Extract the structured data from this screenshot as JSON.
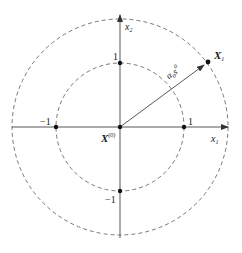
{
  "diagram": {
    "title": "",
    "origin_label": {
      "base": "X",
      "superscript": "(0)"
    },
    "axes": {
      "x": {
        "base": "x",
        "subscript": "1"
      },
      "y": {
        "base": "x",
        "subscript": "2"
      }
    },
    "tick_labels": {
      "x_pos": "1",
      "x_neg": "−1",
      "y_pos": "1",
      "y_neg": "−1"
    },
    "point_label": {
      "base": "X",
      "subscript": "1"
    },
    "vector_label": {
      "base": "α",
      "subscript": "0",
      "var": "s",
      "superscript": "0"
    },
    "circles": [
      {
        "name": "inner",
        "radius_units": 1,
        "style": "dashed"
      },
      {
        "name": "outer",
        "radius_units": 1.7,
        "style": "dashed"
      }
    ],
    "points": [
      {
        "name": "origin",
        "x": 0,
        "y": 0
      },
      {
        "name": "x1-pos",
        "x": 1,
        "y": 0
      },
      {
        "name": "x1-neg",
        "x": -1,
        "y": 0
      },
      {
        "name": "x2-pos",
        "x": 0,
        "y": 1
      },
      {
        "name": "x2-neg",
        "x": 0,
        "y": -1
      },
      {
        "name": "X1",
        "x": 1.38,
        "y": 1.02
      }
    ],
    "colors": {
      "stroke": "#333333",
      "axis": "#444444",
      "text": "#1a1a1a"
    }
  }
}
